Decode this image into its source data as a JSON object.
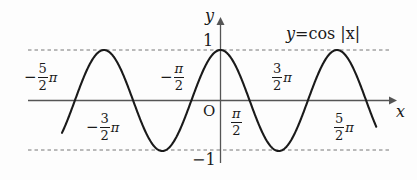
{
  "figure": {
    "background": "#fdfdfd",
    "curve_color": "#1a1a1a",
    "axis_color": "#555555",
    "dash_color": "#777777"
  },
  "equation": {
    "lhs": "y",
    "eq": "=",
    "rhs": "cos |x|",
    "full": "y=cos |x|"
  },
  "axes": {
    "x_label": "x",
    "y_label": "y",
    "origin_label": "O"
  },
  "y_ticks": [
    {
      "label": "1",
      "value": 1
    },
    {
      "label": "−1",
      "value": -1
    }
  ],
  "x_ticks": [
    {
      "id": "neg-5-2-pi",
      "sign": "−",
      "num": "5",
      "den": "2",
      "pi": "π",
      "value": -7.854
    },
    {
      "id": "neg-3-2-pi",
      "sign": "−",
      "num": "3",
      "den": "2",
      "pi": "π",
      "value": -4.712
    },
    {
      "id": "neg-pi-2",
      "sign": "−",
      "num": "π",
      "den": "2",
      "pi": "",
      "value": -1.571
    },
    {
      "id": "pi-2",
      "sign": "",
      "num": "π",
      "den": "2",
      "pi": "",
      "value": 1.571
    },
    {
      "id": "3-2-pi",
      "sign": "",
      "num": "3",
      "den": "2",
      "pi": "π",
      "value": 4.712
    },
    {
      "id": "5-2-pi",
      "sign": "",
      "num": "5",
      "den": "2",
      "pi": "π",
      "value": 7.854
    }
  ],
  "chart_data": {
    "type": "line",
    "title": "y=cos |x|",
    "xlabel": "x",
    "ylabel": "y",
    "xlim": [
      -9.4,
      8.4
    ],
    "ylim": [
      -1.35,
      1.35
    ],
    "grid": false,
    "legend": "none",
    "annotations": [
      "y=cos |x|"
    ],
    "gridlines_dashed_y": [
      1,
      -1
    ],
    "x_tick_labels": [
      "-5/2π",
      "-3/2π",
      "-π/2",
      "O",
      "π/2",
      "3/2π",
      "5/2π"
    ],
    "x_tick_values": [
      -7.854,
      -4.712,
      -1.571,
      0,
      1.571,
      4.712,
      7.854
    ],
    "y_tick_labels": [
      "1",
      "-1"
    ],
    "y_tick_values": [
      1,
      -1
    ],
    "series": [
      {
        "name": "y=cos |x|",
        "formula": "cos(abs(x))",
        "amplitude": 1,
        "period": 6.283,
        "x_start": -8.55,
        "x_end": 8.4,
        "key_points": [
          {
            "x": -7.854,
            "y": 0
          },
          {
            "x": -6.283,
            "y": 1
          },
          {
            "x": -4.712,
            "y": 0
          },
          {
            "x": -3.142,
            "y": -1
          },
          {
            "x": -1.571,
            "y": 0
          },
          {
            "x": 0,
            "y": 1
          },
          {
            "x": 1.571,
            "y": 0
          },
          {
            "x": 3.142,
            "y": -1
          },
          {
            "x": 4.712,
            "y": 0
          },
          {
            "x": 6.283,
            "y": 1
          },
          {
            "x": 7.854,
            "y": 0
          }
        ]
      }
    ]
  }
}
